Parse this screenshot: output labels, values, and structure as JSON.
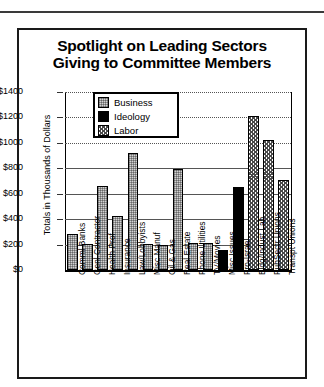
{
  "chart_data": {
    "type": "bar",
    "title": "Spotlight on Leading Sectors Giving to Committee Members",
    "title_line1": "Spotlight on Leading Sectors",
    "title_line2": "Giving to Committee Members",
    "xlabel": "",
    "ylabel": "Totals in Thousands of Dollars",
    "ylim": [
      0,
      1400
    ],
    "ytick_labels": [
      "$1400",
      "$1200",
      "$1000",
      "$800",
      "$600",
      "$400",
      "$200",
      "$0"
    ],
    "ytick_values": [
      1400,
      1200,
      1000,
      800,
      600,
      400,
      200,
      0
    ],
    "grid": true,
    "legend_position": "upper-left-inside",
    "legend": [
      {
        "name": "Business",
        "pattern": "pat-business",
        "swatch_color": "#d2d2d2"
      },
      {
        "name": "Ideology",
        "pattern": "pat-ideology",
        "swatch_color": "#000000"
      },
      {
        "name": "Labor",
        "pattern": "pat-labor",
        "swatch_color": "#ffffff"
      }
    ],
    "categories": [
      "Comml Banks",
      "Genl Contractor",
      "Health Prof",
      "Insurance",
      "Law/Lobbyists",
      "Misc Manuf",
      "Oil & Gas",
      "Real Estate",
      "Phone Utilities",
      "TV/Movies",
      "Misc Issues",
      "Pro-Israel",
      "Bldg/Indust Lab",
      "PubSectr Unions",
      "Transpt Unions"
    ],
    "values": [
      285,
      205,
      660,
      425,
      920,
      205,
      195,
      795,
      210,
      215,
      160,
      650,
      1210,
      1020,
      705
    ],
    "groups": [
      "Business",
      "Business",
      "Business",
      "Business",
      "Business",
      "Business",
      "Business",
      "Business",
      "Business",
      "Business",
      "Ideology",
      "Ideology",
      "Labor",
      "Labor",
      "Labor"
    ]
  }
}
